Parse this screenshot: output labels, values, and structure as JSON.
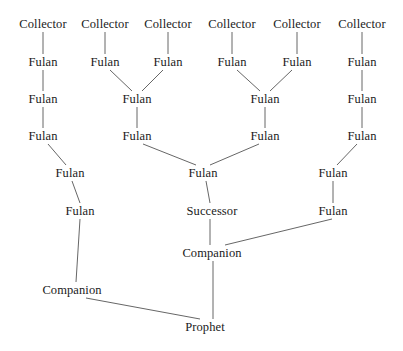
{
  "diagram": {
    "background_color": "#ffffff",
    "text_color": "#1a1a1a",
    "edge_color": "#555555",
    "width": 403,
    "height": 351,
    "nodes": [
      {
        "id": "c1",
        "label": "Collector",
        "x": 43,
        "y": 24
      },
      {
        "id": "c2",
        "label": "Collector",
        "x": 105,
        "y": 24
      },
      {
        "id": "c3",
        "label": "Collector",
        "x": 168,
        "y": 24
      },
      {
        "id": "c4",
        "label": "Collector",
        "x": 232,
        "y": 24
      },
      {
        "id": "c5",
        "label": "Collector",
        "x": 297,
        "y": 24
      },
      {
        "id": "c6",
        "label": "Collector",
        "x": 362,
        "y": 24
      },
      {
        "id": "f1",
        "label": "Fulan",
        "x": 43,
        "y": 62
      },
      {
        "id": "f2",
        "label": "Fulan",
        "x": 105,
        "y": 62
      },
      {
        "id": "f3",
        "label": "Fulan",
        "x": 168,
        "y": 62
      },
      {
        "id": "f4",
        "label": "Fulan",
        "x": 232,
        "y": 62
      },
      {
        "id": "f5",
        "label": "Fulan",
        "x": 297,
        "y": 62
      },
      {
        "id": "f6",
        "label": "Fulan",
        "x": 362,
        "y": 62
      },
      {
        "id": "g1",
        "label": "Fulan",
        "x": 43,
        "y": 99
      },
      {
        "id": "g2",
        "label": "Fulan",
        "x": 137,
        "y": 99
      },
      {
        "id": "g3",
        "label": "Fulan",
        "x": 265,
        "y": 99
      },
      {
        "id": "g4",
        "label": "Fulan",
        "x": 362,
        "y": 99
      },
      {
        "id": "h1",
        "label": "Fulan",
        "x": 43,
        "y": 136
      },
      {
        "id": "h2",
        "label": "Fulan",
        "x": 137,
        "y": 136
      },
      {
        "id": "h3",
        "label": "Fulan",
        "x": 265,
        "y": 136
      },
      {
        "id": "h4",
        "label": "Fulan",
        "x": 362,
        "y": 136
      },
      {
        "id": "i1",
        "label": "Fulan",
        "x": 70,
        "y": 173
      },
      {
        "id": "i2",
        "label": "Fulan",
        "x": 203,
        "y": 173
      },
      {
        "id": "i3",
        "label": "Fulan",
        "x": 333,
        "y": 173
      },
      {
        "id": "j1",
        "label": "Fulan",
        "x": 80,
        "y": 211
      },
      {
        "id": "j2",
        "label": "Successor",
        "x": 212,
        "y": 211
      },
      {
        "id": "j3",
        "label": "Fulan",
        "x": 333,
        "y": 211
      },
      {
        "id": "k1",
        "label": "Companion",
        "x": 212,
        "y": 253
      },
      {
        "id": "k2",
        "label": "Companion",
        "x": 72,
        "y": 290
      },
      {
        "id": "p1",
        "label": "Prophet",
        "x": 205,
        "y": 327
      }
    ],
    "edges": [
      {
        "from": "c1",
        "to": "f1",
        "x1": 43,
        "y1": 32,
        "x2": 43,
        "y2": 54
      },
      {
        "from": "c2",
        "to": "f2",
        "x1": 105,
        "y1": 32,
        "x2": 105,
        "y2": 54
      },
      {
        "from": "c3",
        "to": "f3",
        "x1": 168,
        "y1": 32,
        "x2": 168,
        "y2": 54
      },
      {
        "from": "c4",
        "to": "f4",
        "x1": 232,
        "y1": 32,
        "x2": 232,
        "y2": 54
      },
      {
        "from": "c5",
        "to": "f5",
        "x1": 297,
        "y1": 32,
        "x2": 297,
        "y2": 54
      },
      {
        "from": "c6",
        "to": "f6",
        "x1": 362,
        "y1": 32,
        "x2": 362,
        "y2": 54
      },
      {
        "from": "f1",
        "to": "g1",
        "x1": 43,
        "y1": 70,
        "x2": 43,
        "y2": 91
      },
      {
        "from": "f2",
        "to": "g2",
        "x1": 110,
        "y1": 70,
        "x2": 132,
        "y2": 91
      },
      {
        "from": "f3",
        "to": "g2",
        "x1": 163,
        "y1": 70,
        "x2": 142,
        "y2": 91
      },
      {
        "from": "f4",
        "to": "g3",
        "x1": 237,
        "y1": 70,
        "x2": 260,
        "y2": 91
      },
      {
        "from": "f5",
        "to": "g3",
        "x1": 292,
        "y1": 70,
        "x2": 270,
        "y2": 91
      },
      {
        "from": "f6",
        "to": "g4",
        "x1": 362,
        "y1": 70,
        "x2": 362,
        "y2": 91
      },
      {
        "from": "g1",
        "to": "h1",
        "x1": 43,
        "y1": 107,
        "x2": 43,
        "y2": 128
      },
      {
        "from": "g2",
        "to": "h2",
        "x1": 137,
        "y1": 107,
        "x2": 137,
        "y2": 128
      },
      {
        "from": "g3",
        "to": "h3",
        "x1": 265,
        "y1": 107,
        "x2": 265,
        "y2": 128
      },
      {
        "from": "g4",
        "to": "h4",
        "x1": 362,
        "y1": 107,
        "x2": 362,
        "y2": 128
      },
      {
        "from": "h1",
        "to": "i1",
        "x1": 48,
        "y1": 144,
        "x2": 66,
        "y2": 165
      },
      {
        "from": "h2",
        "to": "i2",
        "x1": 143,
        "y1": 144,
        "x2": 196,
        "y2": 165
      },
      {
        "from": "h3",
        "to": "i2",
        "x1": 259,
        "y1": 144,
        "x2": 210,
        "y2": 165
      },
      {
        "from": "h4",
        "to": "i3",
        "x1": 357,
        "y1": 144,
        "x2": 337,
        "y2": 165
      },
      {
        "from": "i1",
        "to": "j1",
        "x1": 72,
        "y1": 181,
        "x2": 80,
        "y2": 203
      },
      {
        "from": "i2",
        "to": "j2",
        "x1": 206,
        "y1": 181,
        "x2": 210,
        "y2": 203
      },
      {
        "from": "i3",
        "to": "j3",
        "x1": 333,
        "y1": 181,
        "x2": 333,
        "y2": 203
      },
      {
        "from": "j2",
        "to": "k1",
        "x1": 210,
        "y1": 219,
        "x2": 210,
        "y2": 245
      },
      {
        "from": "j3",
        "to": "k1",
        "x1": 332,
        "y1": 219,
        "x2": 225,
        "y2": 245
      },
      {
        "from": "j1",
        "to": "k2",
        "x1": 80,
        "y1": 219,
        "x2": 76,
        "y2": 282
      },
      {
        "from": "k1",
        "to": "p1",
        "x1": 213,
        "y1": 261,
        "x2": 213,
        "y2": 319
      },
      {
        "from": "k2",
        "to": "p1",
        "x1": 86,
        "y1": 298,
        "x2": 200,
        "y2": 319
      }
    ]
  }
}
